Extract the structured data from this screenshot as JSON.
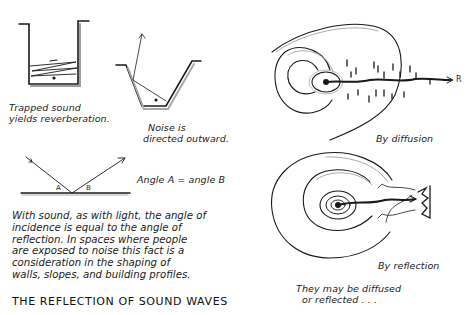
{
  "figure": {
    "title": "THE REFLECTION OF SOUND WAVES",
    "ink_color": "#1a1a1a",
    "shadow_color": "#9a9a9a",
    "background": "#ffffff"
  },
  "panels": {
    "trapped": {
      "caption_line1": "Trapped sound",
      "caption_line2": "yields reverberation."
    },
    "trench": {
      "caption_line1": "Noise is",
      "caption_line2": "directed outward."
    },
    "angle": {
      "label_a": "A",
      "label_b": "B",
      "caption": "Angle A = angle B"
    },
    "paragraph": {
      "lines": [
        "With sound, as with light, the angle of",
        "incidence is equal to the angle of",
        "reflection. In spaces where people",
        "are exposed to noise this fact is a",
        "consideration in the shaping of",
        "walls, slopes, and building profiles."
      ]
    },
    "diffusion": {
      "receiver_label": "R",
      "caption": "By diffusion"
    },
    "reflection": {
      "caption": "By reflection",
      "note_line1": "They may be diffused",
      "note_line2": "or reflected . . ."
    }
  }
}
